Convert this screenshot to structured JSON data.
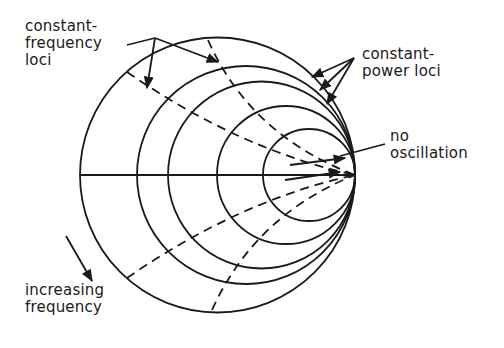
{
  "labels": {
    "constant_frequency": "constant-\nfrequency\nloci",
    "constant_power": "constant-\npower loci",
    "no_oscillation": "no\noscillation",
    "increasing_frequency": "increasing\nfrequency"
  },
  "geometry": {
    "tangent_point": [
      355,
      175
    ],
    "power_circles": [
      {
        "cx": 217.5,
        "r": 137.5
      },
      {
        "cx": 246,
        "r": 109
      },
      {
        "cx": 261.5,
        "r": 93.5
      },
      {
        "cx": 286,
        "r": 69
      },
      {
        "cx": 309,
        "r": 46,
        "hatched": true
      }
    ]
  },
  "colors": {
    "ink": "#1a1a1a",
    "background": "#ffffff"
  }
}
